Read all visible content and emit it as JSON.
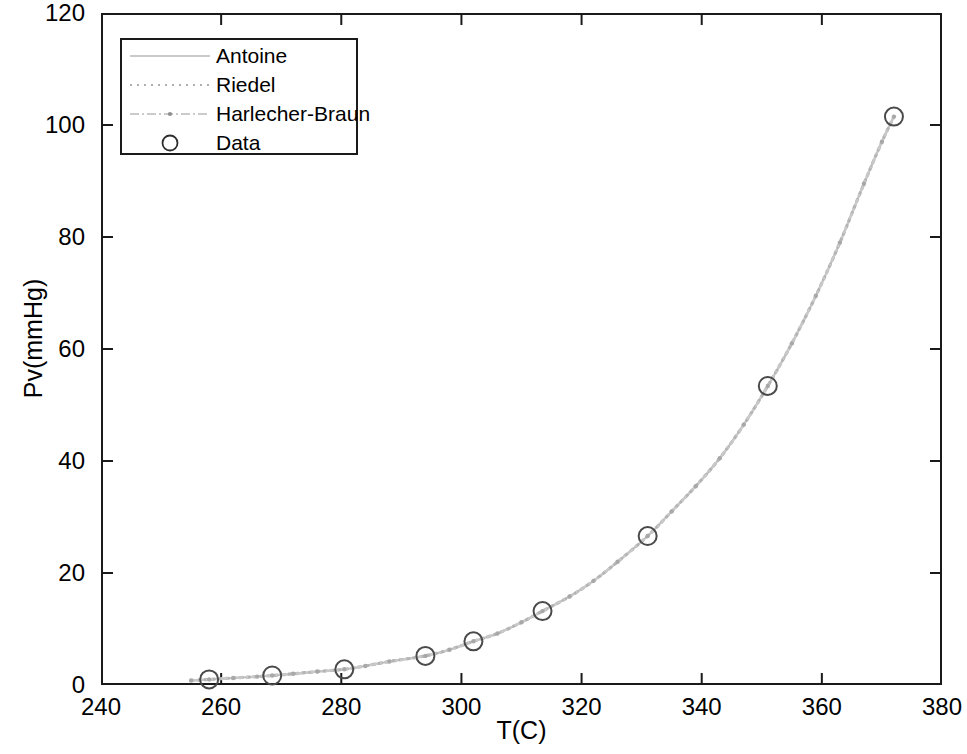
{
  "chart_data": {
    "type": "line",
    "title": "",
    "xlabel": "T(C)",
    "ylabel": "Pv(mmHg)",
    "xlim": [
      240,
      380
    ],
    "ylim": [
      0,
      120
    ],
    "xticks": [
      240,
      260,
      280,
      300,
      320,
      340,
      360,
      380
    ],
    "yticks": [
      0,
      20,
      40,
      60,
      80,
      100,
      120
    ],
    "grid": false,
    "legend_position": "upper left",
    "legend_entries": [
      "Antoine",
      "Riedel",
      "Harlecher-Braun",
      "Data"
    ],
    "series": [
      {
        "name": "Antoine",
        "style": "solid",
        "color": "#c4c4c4",
        "x": [
          255,
          262,
          269,
          276,
          283,
          290,
          297,
          304,
          311,
          318,
          325,
          332,
          339,
          346,
          353,
          360,
          367,
          374
        ],
        "y": [
          0.8,
          1.2,
          1.7,
          2.3,
          3.1,
          4.2,
          5.5,
          7.2,
          9.4,
          12.1,
          15.5,
          19.7,
          24.9,
          31.3,
          39.1,
          48.6,
          60.0,
          73.6
        ]
      },
      {
        "name": "Riedel",
        "style": "dotted",
        "color": "#c4c4c4",
        "x": [
          255,
          262,
          269,
          276,
          283,
          290,
          297,
          304,
          311,
          318,
          325,
          332,
          339,
          346,
          353,
          360,
          367,
          374
        ],
        "y": [
          0.8,
          1.2,
          1.7,
          2.3,
          3.1,
          4.2,
          5.5,
          7.2,
          9.4,
          12.1,
          15.5,
          19.7,
          24.9,
          31.3,
          39.1,
          48.6,
          60.0,
          73.6
        ]
      },
      {
        "name": "Harlecher-Braun",
        "style": "dashdot-marker",
        "color": "#c4c4c4",
        "x": [
          255,
          262,
          269,
          276,
          283,
          290,
          297,
          304,
          311,
          318,
          325,
          332,
          339,
          346,
          353,
          360,
          367,
          374
        ],
        "y": [
          0.8,
          1.2,
          1.7,
          2.3,
          3.1,
          4.2,
          5.5,
          7.2,
          9.4,
          12.1,
          15.5,
          19.7,
          24.9,
          31.3,
          39.1,
          48.6,
          60.0,
          73.6
        ]
      }
    ],
    "data_points": {
      "name": "Data",
      "marker": "open-circle",
      "color": "#4a4a4a",
      "x": [
        258,
        268.5,
        280.5,
        294,
        302,
        313.5,
        331,
        351,
        372
      ],
      "y": [
        1.0,
        1.7,
        2.8,
        5.2,
        7.8,
        13.2,
        26.6,
        53.4,
        101.5
      ]
    },
    "curve_fit": {
      "comment": "Smooth exponential-like vapor pressure curve passing through the data points",
      "x": [
        255,
        258,
        262,
        266,
        268.5,
        272,
        276,
        280.5,
        284,
        288,
        294,
        298,
        302,
        306,
        310,
        313.5,
        318,
        322,
        326,
        331,
        335,
        339,
        343,
        347,
        351,
        355,
        359,
        363,
        367,
        370,
        372
      ],
      "y": [
        0.8,
        1.0,
        1.25,
        1.5,
        1.7,
        2.0,
        2.4,
        2.8,
        3.4,
        4.2,
        5.2,
        6.3,
        7.8,
        9.2,
        11.2,
        13.2,
        15.8,
        18.6,
        22.0,
        26.6,
        31.0,
        35.5,
        40.5,
        46.5,
        53.4,
        61.0,
        69.5,
        79.0,
        89.5,
        97.0,
        101.5
      ]
    }
  },
  "axes": {
    "y_tick_labels": [
      "0",
      "20",
      "40",
      "60",
      "80",
      "100",
      "120"
    ],
    "x_tick_labels": [
      "240",
      "260",
      "280",
      "300",
      "320",
      "340",
      "360",
      "380"
    ],
    "y_title": "Pv(mmHg)",
    "x_title": "T(C)"
  },
  "legend": {
    "items": [
      {
        "label": "Antoine",
        "key": "solid-line-key"
      },
      {
        "label": "Riedel",
        "key": "dotted-line-key"
      },
      {
        "label": "Harlecher-Braun",
        "key": "dashdot-marker-key"
      },
      {
        "label": "Data",
        "key": "open-circle-key"
      }
    ]
  },
  "colors": {
    "axis": "#1a1a1a",
    "curve": "#c4c4c4",
    "marker": "#4a4a4a",
    "background": "#ffffff"
  }
}
